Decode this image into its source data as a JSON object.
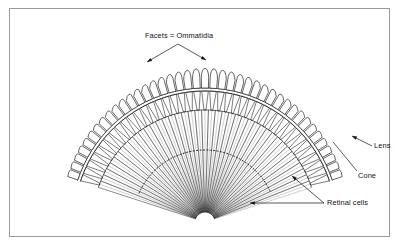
{
  "figure": {
    "kind": "diagram",
    "background_color": "#ffffff",
    "ink_color": "#111111",
    "frame": {
      "border_color": "#9a9a9a",
      "x": 9,
      "y": 8,
      "width": 381,
      "height": 229
    }
  },
  "labels": {
    "facets": "Facets = Ommatidia",
    "lens": "Lens",
    "cone": "Cone",
    "retinal": "Retinal cells"
  },
  "geometry": {
    "center_x": 205,
    "center_y": 222,
    "facet_count": 41,
    "angle_start_deg": -72,
    "angle_end_deg": 72,
    "radius_lens_outer": 152,
    "radius_lens_inner": 134,
    "radius_cone_outer": 131,
    "radius_cone_inner": 112,
    "radius_retina_inner": 10,
    "lens_cap_ratio": 0.42,
    "cone_taper_ratio": 0.34,
    "retinal_lines_per_ommatidium": 2,
    "dotted_arc_radius": 72
  },
  "leaders": {
    "facets": {
      "apex_x": 178,
      "apex_y": 44,
      "arrow_left_x": 147,
      "arrow_left_y": 62,
      "arrow_right_x": 206,
      "arrow_right_y": 60
    },
    "lens": {
      "tail_x": 372,
      "tail_y": 146,
      "tip_x": 352,
      "tip_y": 136
    },
    "cone": {
      "tail_x": 357,
      "tail_y": 171,
      "tip_x": 333,
      "tip_y": 142
    },
    "retinal": {
      "tail_x": 324,
      "tail_y": 203,
      "tip_a_x": 250,
      "tip_a_y": 203,
      "tip_b_x": 292,
      "tip_b_y": 176
    }
  }
}
